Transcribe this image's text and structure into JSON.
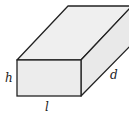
{
  "diagram": {
    "shape": "rectangular-prism",
    "labels": {
      "height": "h",
      "length": "l",
      "depth": "d"
    },
    "colors": {
      "fill": "#ececec",
      "stroke": "#222222"
    }
  }
}
